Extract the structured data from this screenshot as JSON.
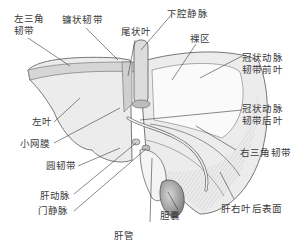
{
  "figure": {
    "labels": {
      "left_triangular_ligament": "左三角\n韧带",
      "falciform_ligament": "镰状韧带",
      "caudate_lobe": "尾状叶",
      "inferior_vena_cava": "下腔静脉",
      "bare_area": "裸区",
      "coronary_ligament_anterior": "冠状动脉\n韧带前叶",
      "left_lobe": "左叶",
      "coronary_ligament_posterior": "冠状动脉\n韧带后叶",
      "lesser_omentum": "小网膜",
      "right_triangular_ligament": "右三角韧带",
      "round_ligament": "圆韧带",
      "hepatic_artery": "肝动脉",
      "portal_vein": "门静脉",
      "gallbladder": "胆囊",
      "right_lobe_posterior_surface": "肝右叶后表面",
      "hepatic_duct": "肝管"
    },
    "colors": {
      "ink": "#3a3a3a",
      "shade_dark": "#8a8a8a",
      "shade_mid": "#c4c4c4",
      "shade_light": "#e6e6e6",
      "background": "#ffffff"
    }
  }
}
